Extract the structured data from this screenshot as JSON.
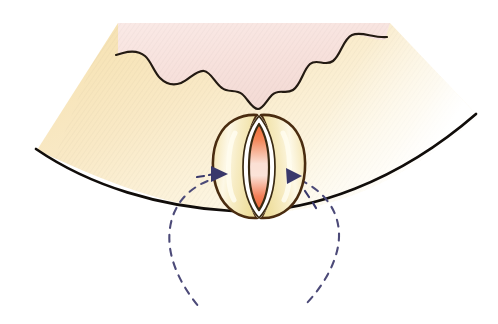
{
  "figure": {
    "kind": "biological-cross-section-illustration",
    "background_color": "#ffffff",
    "canvas": {
      "width": 498,
      "height": 324
    }
  },
  "regions": [
    {
      "id": "upper-tissue",
      "label": "upper pink tissue layer",
      "fill_start": "#f9e6e3",
      "fill_end": "#f5ded9",
      "outline": "none"
    },
    {
      "id": "lower-tissue",
      "label": "lower cream mesophyll layer",
      "fill_start": "#f7e4b8",
      "fill_end": "#fcf4dd",
      "outline": "none"
    }
  ],
  "outlines": {
    "wavy_boundary": {
      "label": "wavy cell boundary between pink and cream layers",
      "color": "#231a12",
      "width": 2.2
    },
    "lower_arc": {
      "label": "lower curved epidermis outline",
      "color": "#110d0a",
      "width": 2.6
    }
  },
  "stoma": {
    "label": "stoma with two guard cells",
    "guard_cell_outline": "#4a2c10",
    "guard_cell_outline_width": 2.6,
    "guard_cell_fill_start": "#f4e4ae",
    "guard_cell_fill_end": "#fbf3d8",
    "guard_cell_highlight": "#fffdf2",
    "inner_ring_color": "#ffffff",
    "pore_outline": "#3a2a12",
    "pore_fill_top": "#f0703c",
    "pore_fill_middle": "#fbeae2",
    "pore_fill_bottom": "#ef6e3a",
    "center_x": 259,
    "center_y": 166,
    "width": 84,
    "height": 106
  },
  "annotations": {
    "arrows": [
      {
        "id": "left-arrow",
        "label": "left guard cell turgor direction arrow",
        "color": "#39386b",
        "tip_x": 224,
        "tip_y": 173,
        "direction": "right"
      },
      {
        "id": "right-arrow",
        "label": "right guard cell turgor direction arrow",
        "color": "#39386b",
        "tip_x": 300,
        "tip_y": 176,
        "direction": "right"
      }
    ],
    "dashed_circle": {
      "id": "dashed-guide-circle",
      "label": "dashed reference circle around stoma region",
      "color": "#4c4a78",
      "width": 2.2,
      "dash": "7 7",
      "center_x": 254,
      "center_y": 231,
      "radius_x": 83,
      "radius_y": 80
    }
  },
  "palette": {
    "white": "#ffffff",
    "pink": "#f7e2de",
    "cream": "#f7e4b8",
    "brown_outline": "#4a2c10",
    "black_outline": "#110d0a",
    "orange_pore": "#ef6e3a",
    "navy_annotation": "#39386b"
  }
}
